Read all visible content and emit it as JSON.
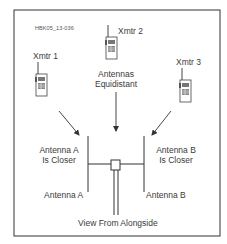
{
  "figure_id": "HBK05_13-036",
  "transmitters": [
    {
      "label": "Xmtr 1",
      "position": "left"
    },
    {
      "label": "Xmtr 2",
      "position": "top-center"
    },
    {
      "label": "Xmtr 3",
      "position": "right"
    }
  ],
  "annotations": {
    "center": [
      "Antennas",
      "Equidistant"
    ],
    "left": [
      "Antenna A",
      "Is Closer"
    ],
    "right": [
      "Antenna B",
      "Is Closer"
    ]
  },
  "antennas": {
    "a_label": "Antenna A",
    "b_label": "Antenna B"
  },
  "caption": "View From Alongside",
  "colors": {
    "line": "#333333",
    "frame": "#333333",
    "text": "#3a3a3a"
  }
}
